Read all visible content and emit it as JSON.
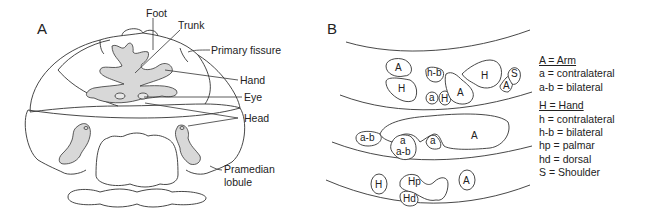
{
  "panels": {
    "a": {
      "letter": "A",
      "labels": {
        "foot": "Foot",
        "trunk": "Trunk",
        "primary_fissure": "Primary fissure",
        "hand": "Hand",
        "eye": "Eye",
        "head": "Head",
        "pramedian_1": "Pramedian",
        "pramedian_2": "lobule"
      }
    },
    "b": {
      "letter": "B",
      "regions": {
        "row1": [
          "A",
          "H",
          "h-b",
          "a",
          "H",
          "A",
          "H",
          "A",
          "S"
        ],
        "row2": [
          "a-b",
          "a",
          "a-b",
          "a",
          "A"
        ],
        "row3": [
          "H",
          "Hp",
          "Hd",
          "A"
        ]
      },
      "legend": {
        "arm_header": "A = Arm",
        "arm_items": [
          "a = contralateral",
          "a-b = bilateral"
        ],
        "hand_header": "H = Hand",
        "hand_items": [
          "h = contralateral",
          "h-b = bilateral",
          "hp = palmar",
          "hd = dorsal",
          "S = Shoulder"
        ]
      }
    }
  },
  "colors": {
    "stroke": "#333333",
    "fill_gray": "#d8d8d8",
    "text": "#222222"
  }
}
